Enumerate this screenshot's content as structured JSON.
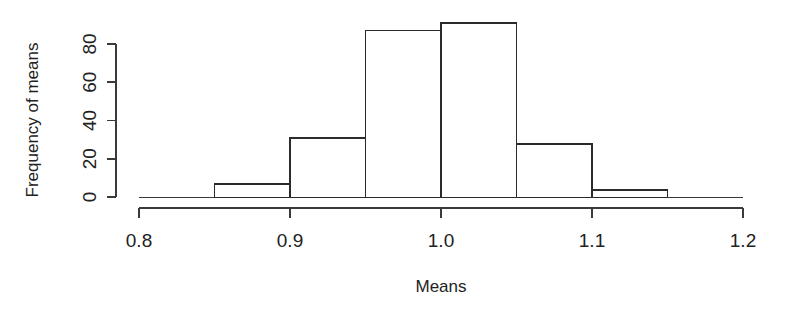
{
  "chart_data": {
    "type": "bar",
    "subtype": "histogram",
    "title": "",
    "xlabel": "Means",
    "ylabel": "Frequency of means",
    "categories": [
      "0.85-0.90",
      "0.90-0.95",
      "0.95-1.00",
      "1.00-1.05",
      "1.05-1.10",
      "1.10-1.15"
    ],
    "bin_edges": [
      0.85,
      0.9,
      0.95,
      1.0,
      1.05,
      1.1,
      1.15
    ],
    "bin_width": 0.05,
    "values": [
      7,
      31,
      87,
      91,
      28,
      4
    ],
    "bars": [
      {
        "x0": 0.85,
        "x1": 0.9,
        "value": 7
      },
      {
        "x0": 0.9,
        "x1": 0.95,
        "value": 31
      },
      {
        "x0": 0.95,
        "x1": 1.0,
        "value": 87
      },
      {
        "x0": 1.0,
        "x1": 1.05,
        "value": 91
      },
      {
        "x0": 1.05,
        "x1": 1.1,
        "value": 28
      },
      {
        "x0": 1.1,
        "x1": 1.15,
        "value": 4
      }
    ],
    "xlim": [
      0.8,
      1.2
    ],
    "ylim": [
      0,
      92
    ],
    "xticks": [
      0.8,
      0.9,
      1.0,
      1.1,
      1.2
    ],
    "xtick_labels": [
      "0.8",
      "0.9",
      "1.0",
      "1.1",
      "1.2"
    ],
    "yticks": [
      0,
      20,
      40,
      60,
      80
    ],
    "ytick_labels": [
      "0",
      "20",
      "40",
      "60",
      "80"
    ],
    "grid": false,
    "legend": false,
    "bar_fill": "#ffffff",
    "bar_stroke": "#2b2b2b",
    "axis_color": "#3a3a3a",
    "background": "#ffffff"
  },
  "axes": {
    "x_title": "Means",
    "y_title": "Frequency of means"
  },
  "xtick_labels": {
    "t0": "0.8",
    "t1": "0.9",
    "t2": "1.0",
    "t3": "1.1",
    "t4": "1.2"
  },
  "ytick_labels": {
    "t0": "0",
    "t1": "20",
    "t2": "40",
    "t3": "60",
    "t4": "80"
  }
}
